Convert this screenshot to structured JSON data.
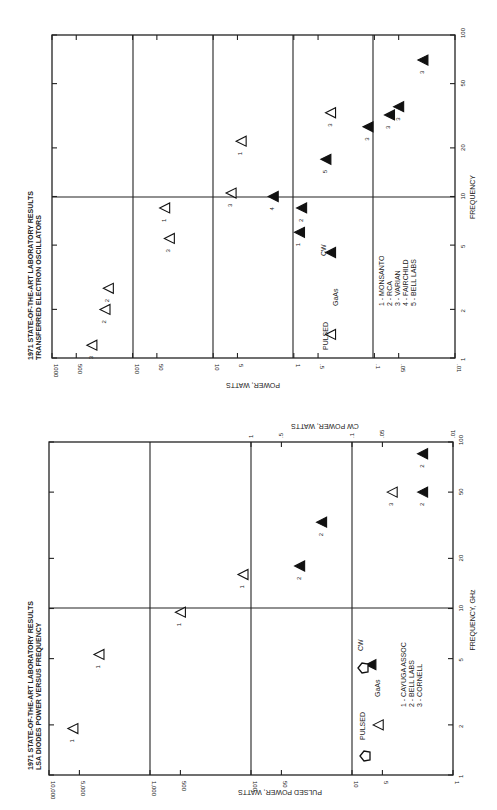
{
  "chart_data": [
    {
      "type": "scatter",
      "title": "1971 STATE-OF-THE-ART LABORATORY RESULTS",
      "subtitle": "TRANSFERRED ELECTRON OSCILLATORS",
      "xlabel": "FREQUENCY",
      "ylabel": "POWER, WATTS",
      "x_scale": "log",
      "y_scale": "log",
      "xlim": [
        1,
        100
      ],
      "ylim": [
        0.01,
        1000
      ],
      "x_ticks": [
        "1",
        "2",
        "5",
        "10",
        "20",
        "50",
        "100"
      ],
      "y_ticks": [
        "1000",
        "500",
        "100",
        "50",
        "10",
        "5",
        "1",
        ".5",
        ".1",
        ".05",
        ".01"
      ],
      "grid": true,
      "legend": [
        "1 - MONSANTO",
        "2 - RCA",
        "3 - VARIAN",
        "4 - FAIRCHILD",
        "5 - BELL LABS"
      ],
      "annotations": [
        "PULSED",
        "CW",
        "GaAs"
      ],
      "series": [
        {
          "name": "PULSED (open triangle)",
          "points": [
            {
              "freq": 1.2,
              "power": 320,
              "label": "3"
            },
            {
              "freq": 2.0,
              "power": 220,
              "label": "2"
            },
            {
              "freq": 2.7,
              "power": 200,
              "label": "2"
            },
            {
              "freq": 5.5,
              "power": 35,
              "label": "3"
            },
            {
              "freq": 8.5,
              "power": 40,
              "label": "1"
            },
            {
              "freq": 10.5,
              "power": 6,
              "label": "3"
            },
            {
              "freq": 22,
              "power": 4.5,
              "label": "1"
            },
            {
              "freq": 33,
              "power": 0.35,
              "label": "3"
            },
            {
              "freq": 1.4,
              "power": 0.35,
              "label": ""
            }
          ]
        },
        {
          "name": "CW (filled triangle)",
          "points": [
            {
              "freq": 10.0,
              "power": 1.8,
              "label": "4"
            },
            {
              "freq": 8.5,
              "power": 0.8,
              "label": "2"
            },
            {
              "freq": 6.0,
              "power": 0.85,
              "label": "1"
            },
            {
              "freq": 4.5,
              "power": 0.35,
              "label": ""
            },
            {
              "freq": 17,
              "power": 0.4,
              "label": "5"
            },
            {
              "freq": 27,
              "power": 0.12,
              "label": "3"
            },
            {
              "freq": 32,
              "power": 0.065,
              "label": "3"
            },
            {
              "freq": 36,
              "power": 0.05,
              "label": "3"
            },
            {
              "freq": 70,
              "power": 0.025,
              "label": "3"
            }
          ]
        }
      ]
    },
    {
      "type": "scatter",
      "title": "1971 STATE-OF-THE-ART LABORATORY RESULTS",
      "subtitle": "LSA DIODES POWER VERSUS FREQUENCY",
      "xlabel": "FREQUENCY, GHz",
      "ylabel": "PULSED POWER, WATTS",
      "y2label": "CW POWER, WATTS",
      "x_scale": "log",
      "y_scale": "log",
      "xlim": [
        1,
        100
      ],
      "ylim": [
        1,
        10000
      ],
      "y2lim": [
        0.01,
        1
      ],
      "x_ticks": [
        "1",
        "2",
        "5",
        "10",
        "20",
        "50",
        "100"
      ],
      "y_ticks": [
        "10,000",
        "5,000",
        "1,000",
        "500",
        "100",
        "50",
        "10",
        "5",
        "1"
      ],
      "y2_ticks": [
        "1",
        ".5",
        ".1",
        ".05",
        ".01"
      ],
      "grid": true,
      "legend": [
        "1 - CAYUGA ASSOC",
        "2 - BELL LABS",
        "3 - CORNELL"
      ],
      "annotations": [
        "PULSED",
        "CW",
        "GaAs"
      ],
      "series": [
        {
          "name": "PULSED (open triangle)",
          "points": [
            {
              "freq": 1.9,
              "power": 5800,
              "label": "1"
            },
            {
              "freq": 5.3,
              "power": 3200,
              "label": "1"
            },
            {
              "freq": 9.5,
              "power": 500,
              "label": "1"
            },
            {
              "freq": 16,
              "power": 120,
              "label": "1"
            },
            {
              "freq": 2.0,
              "power": 5.5,
              "label": ""
            },
            {
              "freq": 50,
              "power": 0.04,
              "label": "3",
              "axis": "cw"
            }
          ]
        },
        {
          "name": "CW (filled triangle)",
          "points": [
            {
              "freq": 18,
              "power": 0.33,
              "label": "2",
              "axis": "cw"
            },
            {
              "freq": 33,
              "power": 0.2,
              "label": "2",
              "axis": "cw"
            },
            {
              "freq": 50,
              "power": 0.02,
              "label": "2",
              "axis": "cw"
            },
            {
              "freq": 85,
              "power": 0.02,
              "label": "2",
              "axis": "cw"
            },
            {
              "freq": 4.6,
              "power": 0.065,
              "label": "",
              "axis": "cw"
            }
          ]
        }
      ]
    }
  ],
  "top_chart": {
    "title": "1971 STATE-OF-THE-ART LABORATORY RESULTS",
    "subtitle": "TRANSFERRED ELECTRON OSCILLATORS",
    "freq_label": "FREQUENCY",
    "power_label": "POWER, WATTS",
    "legend": [
      "1 - MONSANTO",
      "2 - RCA",
      "3 - VARIAN",
      "4 - FAIRCHILD",
      "5 - BELL LABS"
    ],
    "pulsed": "PULSED",
    "cw": "CW",
    "gaas": "GaAs"
  },
  "bottom_chart": {
    "title": "1971 STATE-OF-THE-ART LABORATORY RESULTS",
    "subtitle": "LSA DIODES POWER VERSUS FREQUENCY",
    "freq_label": "FREQUENCY, GHz",
    "power_label": "PULSED POWER, WATTS",
    "cw_power_label": "CW POWER, WATTS",
    "legend": [
      "1 - CAYUGA ASSOC",
      "2 - BELL LABS",
      "3 - CORNELL"
    ],
    "pulsed": "PULSED",
    "cw": "CW",
    "gaas": "GaAs"
  }
}
